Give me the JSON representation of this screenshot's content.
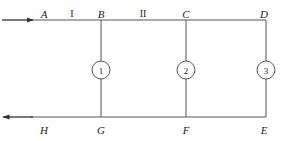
{
  "figure": {
    "type": "pipe-network-schematic",
    "background_color": "#ffffff",
    "line_color": "#555555",
    "text_color": "#1a1a1a",
    "width": 283,
    "height": 141
  },
  "rails": {
    "top": {
      "y": 20,
      "x_start": 30,
      "x_end": 266
    },
    "bottom": {
      "y": 117,
      "x_start": 30,
      "x_end": 266
    }
  },
  "flow_arrows": [
    {
      "name": "inlet-arrow",
      "direction": "right",
      "y": 20,
      "x_start": 2,
      "x_end": 34
    },
    {
      "name": "outlet-arrow",
      "direction": "left",
      "y": 117,
      "x_start": 2,
      "x_end": 34
    }
  ],
  "verticals": [
    {
      "name": "branch-BG",
      "x": 101,
      "top_y": 20,
      "bottom_y": 117
    },
    {
      "name": "branch-CF",
      "x": 186,
      "top_y": 20,
      "bottom_y": 117
    },
    {
      "name": "branch-DE",
      "x": 266,
      "top_y": 20,
      "bottom_y": 117
    }
  ],
  "top_nodes": [
    {
      "label": "A",
      "x": 44,
      "y": 9
    },
    {
      "label": "B",
      "x": 101,
      "y": 9
    },
    {
      "label": "C",
      "x": 186,
      "y": 9
    },
    {
      "label": "D",
      "x": 264,
      "y": 9
    }
  ],
  "bottom_nodes": [
    {
      "label": "H",
      "x": 44,
      "y": 125
    },
    {
      "label": "G",
      "x": 101,
      "y": 125
    },
    {
      "label": "F",
      "x": 186,
      "y": 125
    },
    {
      "label": "E",
      "x": 264,
      "y": 125
    }
  ],
  "section_labels": [
    {
      "label": "I",
      "x": 72,
      "y": 9
    },
    {
      "label": "II",
      "x": 143,
      "y": 9
    }
  ],
  "branch_markers": [
    {
      "label": "1",
      "x": 101,
      "y": 70
    },
    {
      "label": "2",
      "x": 186,
      "y": 70
    },
    {
      "label": "3",
      "x": 266,
      "y": 70
    }
  ]
}
